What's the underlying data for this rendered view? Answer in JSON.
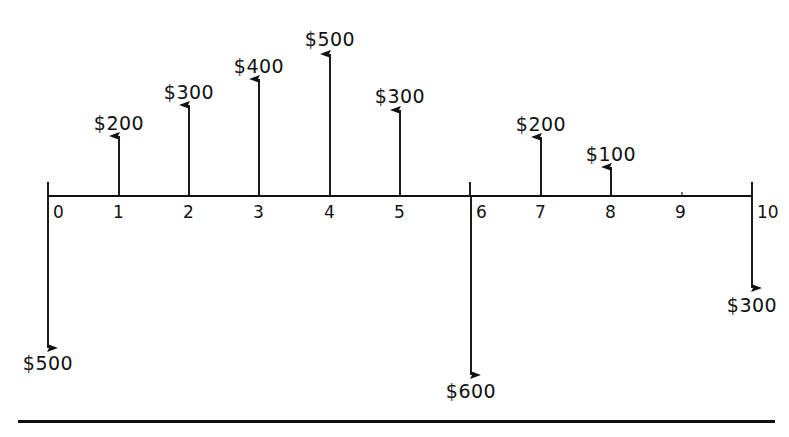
{
  "axis": {
    "label": "time-period-axis",
    "x_start": 48,
    "x_end": 752,
    "y": 196,
    "period_spacing": 70.4,
    "tick_labels": [
      "0",
      "1",
      "2",
      "3",
      "4",
      "5",
      "6",
      "7",
      "8",
      "9",
      "10"
    ],
    "tick_label_y": 215
  },
  "currency_symbol": "$",
  "colors": {
    "ink": "#111111",
    "background": "#ffffff"
  },
  "chart_data": {
    "type": "bar",
    "xlabel": "Period",
    "ylabel": "Cash Flow ($)",
    "categories": [
      "0",
      "1",
      "2",
      "3",
      "4",
      "5",
      "6",
      "7",
      "8",
      "9",
      "10"
    ],
    "values": [
      -500,
      200,
      300,
      400,
      500,
      300,
      -600,
      200,
      100,
      0,
      -300
    ],
    "ylim": [
      -600,
      500
    ],
    "grid": false,
    "legend": null
  },
  "cashflows": [
    {
      "name": "flow-period-0",
      "period": 0,
      "direction": "down",
      "amount": -500,
      "label": "$500",
      "arrow_x": 48,
      "arrow_top": 196,
      "arrow_tip": 348,
      "label_x": 48,
      "label_y": 352
    },
    {
      "name": "flow-period-1",
      "period": 1,
      "direction": "up",
      "amount": 200,
      "label": "$200",
      "arrow_x": 119,
      "arrow_tip": 136,
      "arrow_base": 196,
      "label_x": 119,
      "label_y": 112
    },
    {
      "name": "flow-period-2",
      "period": 2,
      "direction": "up",
      "amount": 300,
      "label": "$300",
      "arrow_x": 189,
      "arrow_tip": 105,
      "arrow_base": 196,
      "label_x": 189,
      "label_y": 81
    },
    {
      "name": "flow-period-3",
      "period": 3,
      "direction": "up",
      "amount": 400,
      "label": "$400",
      "arrow_x": 259,
      "arrow_tip": 79,
      "arrow_base": 196,
      "label_x": 259,
      "label_y": 55
    },
    {
      "name": "flow-period-4",
      "period": 4,
      "direction": "up",
      "amount": 500,
      "label": "$500",
      "arrow_x": 330,
      "arrow_tip": 54,
      "arrow_base": 196,
      "label_x": 330,
      "label_y": 28
    },
    {
      "name": "flow-period-5",
      "period": 5,
      "direction": "up",
      "amount": 300,
      "label": "$300",
      "arrow_x": 400,
      "arrow_tip": 110,
      "arrow_base": 196,
      "label_x": 400,
      "label_y": 85
    },
    {
      "name": "flow-period-6",
      "period": 6,
      "direction": "down",
      "amount": -600,
      "label": "$600",
      "arrow_x": 471,
      "arrow_top": 196,
      "arrow_tip": 375,
      "label_x": 471,
      "label_y": 380
    },
    {
      "name": "flow-period-7",
      "period": 7,
      "direction": "up",
      "amount": 200,
      "label": "$200",
      "arrow_x": 541,
      "arrow_tip": 137,
      "arrow_base": 196,
      "label_x": 541,
      "label_y": 113
    },
    {
      "name": "flow-period-8",
      "period": 8,
      "direction": "up",
      "amount": 100,
      "label": "$100",
      "arrow_x": 611,
      "arrow_tip": 167,
      "arrow_base": 196,
      "label_x": 611,
      "label_y": 143
    },
    {
      "name": "flow-period-10",
      "period": 10,
      "direction": "down",
      "amount": -300,
      "label": "$300",
      "arrow_x": 752,
      "arrow_top": 196,
      "arrow_tip": 288,
      "label_x": 752,
      "label_y": 294
    }
  ],
  "tick_label_positions": [
    {
      "text": "0",
      "x": 53,
      "y": 202
    },
    {
      "text": "1",
      "x": 113,
      "y": 202
    },
    {
      "text": "2",
      "x": 183,
      "y": 202
    },
    {
      "text": "3",
      "x": 253,
      "y": 202
    },
    {
      "text": "4",
      "x": 324,
      "y": 202
    },
    {
      "text": "5",
      "x": 394,
      "y": 202
    },
    {
      "text": "6",
      "x": 476,
      "y": 202
    },
    {
      "text": "7",
      "x": 535,
      "y": 202
    },
    {
      "text": "8",
      "x": 605,
      "y": 202
    },
    {
      "text": "9",
      "x": 675,
      "y": 202
    },
    {
      "text": "10",
      "x": 757,
      "y": 202
    }
  ]
}
